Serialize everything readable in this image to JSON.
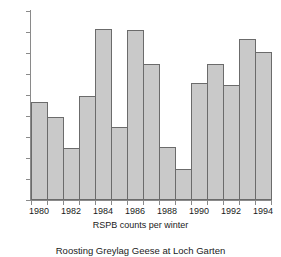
{
  "chart_data": {
    "type": "bar",
    "title": "Roosting Greylag Geese at Loch Garten",
    "xlabel": "RSPB counts per winter",
    "ylabel": "",
    "categories": [
      1980,
      1981,
      1982,
      1983,
      1984,
      1985,
      1986,
      1987,
      1988,
      1989,
      1990,
      1991,
      1992,
      1993,
      1994
    ],
    "values": [
      930,
      795,
      500,
      990,
      1630,
      695,
      1615,
      1300,
      505,
      295,
      1110,
      1300,
      1100,
      1530,
      1410
    ],
    "ylim": [
      0,
      1800
    ],
    "ytick_labels": [
      "1800",
      "1600",
      "1400",
      "1200",
      "1000",
      "800",
      "600",
      "400",
      "200",
      "0"
    ],
    "ytick_values": [
      1800,
      1600,
      1400,
      1200,
      1000,
      800,
      600,
      400,
      200,
      0
    ],
    "xtick_labels": [
      "1980",
      "1982",
      "1984",
      "1986",
      "1988",
      "1990",
      "1992",
      "1994"
    ],
    "xtick_values": [
      1980,
      1982,
      1984,
      1986,
      1988,
      1990,
      1992,
      1994
    ],
    "grid": false,
    "legend": false,
    "bar_color": "#c9c9c9",
    "bar_edge_color": "#6b6b6b",
    "axis_color": "#8a8a8a"
  }
}
